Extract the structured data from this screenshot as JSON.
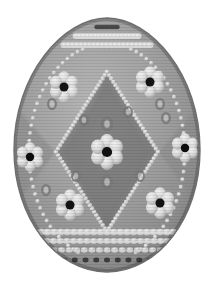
{
  "image": {
    "subject": "decorated easter egg",
    "style": "pysanka folk ornament, grayscale",
    "background_color": "#ffffff",
    "width": 218,
    "height": 288,
    "caption": "Decorated Easter egg"
  },
  "egg": {
    "center_x": 107,
    "center_y": 152,
    "radius_x": 93,
    "radius_y": 127,
    "top_y": 18,
    "bottom_y": 272,
    "left_x": 14,
    "right_x": 200,
    "shell_color": "#9a9a9a",
    "shell_color_light": "#b4b4b4",
    "shell_color_dark": "#7c7c7c",
    "outline_color": "#6e6e6e",
    "texture": "horizontal scanlines"
  },
  "palette": {
    "dot_light": "#dedede",
    "dot_mid": "#c2c2c2",
    "dot_shadow": "#7a7a7a",
    "dot_dark": "#5d5d5d",
    "flower_center": "#111111",
    "petal_light": "#e6e6e6",
    "petal_mid": "#cccccc",
    "bead_line": "#d4d4d4",
    "panel_dark": "#808080",
    "panel_darker": "#767676",
    "highlight": "#f0f0f0"
  },
  "ornament": {
    "bands": [
      {
        "name": "top-dark-dot-band",
        "y": 27,
        "dot_count": 13,
        "dot_color": "#4a4a4a",
        "dot_r": 2.2
      },
      {
        "name": "top-light-dot-band-1",
        "y": 36,
        "dot_count": 17,
        "dot_color": "#dcdcdc",
        "dot_r": 3.0
      },
      {
        "name": "top-light-dot-band-2",
        "y": 45,
        "dot_count": 21,
        "dot_color": "#d6d6d6",
        "dot_r": 3.2
      },
      {
        "name": "bottom-light-dot-band-1",
        "y": 232,
        "dot_count": 21,
        "dot_color": "#d8d8d8",
        "dot_r": 3.2
      },
      {
        "name": "bottom-light-dot-band-2",
        "y": 241,
        "dot_count": 19,
        "dot_color": "#d4d4d4",
        "dot_r": 3.0
      },
      {
        "name": "bottom-light-dot-band-3",
        "y": 250,
        "dot_count": 15,
        "dot_color": "#d0d0d0",
        "dot_r": 2.8
      },
      {
        "name": "bottom-dark-dot-band",
        "y": 260,
        "dot_count": 9,
        "dot_color": "#3c3c3c",
        "dot_r": 2.4
      }
    ],
    "center_diamond": {
      "name": "central-diamond-panel",
      "top": [
        107,
        72
      ],
      "right": [
        158,
        152
      ],
      "bottom": [
        107,
        232
      ],
      "left": [
        56,
        152
      ],
      "fill": "#828282",
      "bead_color": "#dcdcdc",
      "bead_count": 96
    },
    "side_diamonds": [
      {
        "name": "left-diamond-panel",
        "cx": 40,
        "cy": 152,
        "fill": "#8c8c8c"
      },
      {
        "name": "right-diamond-panel",
        "cx": 174,
        "cy": 152,
        "fill": "#8c8c8c"
      }
    ],
    "flowers": [
      {
        "name": "flower-center",
        "cx": 107,
        "cy": 152,
        "petals": 6,
        "size": 17,
        "center_color": "#111111"
      },
      {
        "name": "flower-top-left",
        "cx": 64,
        "cy": 87,
        "petals": 6,
        "size": 15,
        "center_color": "#141414"
      },
      {
        "name": "flower-top-right",
        "cx": 150,
        "cy": 82,
        "petals": 6,
        "size": 15,
        "center_color": "#141414"
      },
      {
        "name": "flower-left",
        "cx": 30,
        "cy": 157,
        "petals": 6,
        "size": 14,
        "center_color": "#0e0e0e"
      },
      {
        "name": "flower-right",
        "cx": 185,
        "cy": 148,
        "petals": 6,
        "size": 14,
        "center_color": "#0e0e0e"
      },
      {
        "name": "flower-bottom-left",
        "cx": 70,
        "cy": 205,
        "petals": 6,
        "size": 15,
        "center_color": "#141414"
      },
      {
        "name": "flower-bottom-right",
        "cx": 160,
        "cy": 203,
        "petals": 6,
        "size": 15,
        "center_color": "#141414"
      }
    ],
    "small_rings": [
      {
        "cx": 52,
        "cy": 104,
        "r": 4
      },
      {
        "cx": 84,
        "cy": 120,
        "r": 4
      },
      {
        "cx": 128,
        "cy": 112,
        "r": 4
      },
      {
        "cx": 160,
        "cy": 104,
        "r": 4
      },
      {
        "cx": 107,
        "cy": 124,
        "r": 5
      },
      {
        "cx": 107,
        "cy": 182,
        "r": 5
      },
      {
        "cx": 76,
        "cy": 176,
        "r": 4
      },
      {
        "cx": 140,
        "cy": 176,
        "r": 4
      },
      {
        "cx": 46,
        "cy": 190,
        "r": 4
      },
      {
        "cx": 166,
        "cy": 118,
        "r": 4
      }
    ],
    "bead_strings": [
      {
        "name": "left-outer-bead-arc"
      },
      {
        "name": "right-outer-bead-arc"
      },
      {
        "name": "center-diamond-bead-outline"
      }
    ]
  },
  "labels": {
    "title": "Decorated Easter Egg",
    "alt": "Grayscale illustration of an ornately decorated Easter egg with beaded diamond lattice and seven flower motifs"
  }
}
